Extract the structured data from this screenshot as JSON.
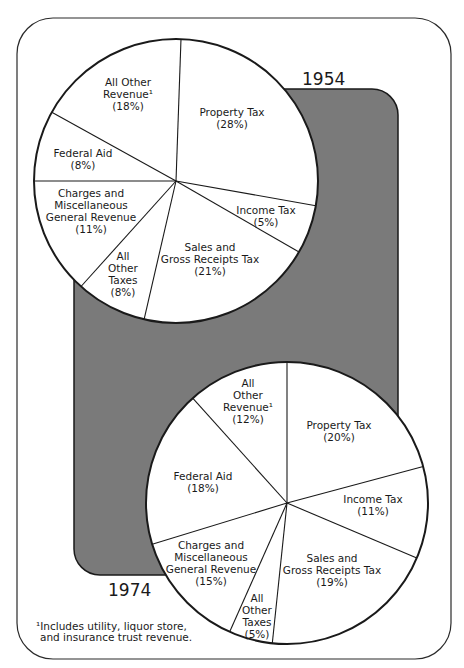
{
  "chart_data": [
    {
      "type": "pie",
      "title": "1954",
      "categories": [
        "Property Tax",
        "Income Tax",
        "Sales and Gross Receipts Tax",
        "All Other Taxes",
        "Charges and Miscellaneous General Revenue",
        "Federal Aid",
        "All Other Revenue¹"
      ],
      "values": [
        28,
        5,
        21,
        8,
        11,
        8,
        18
      ],
      "unit": "%"
    },
    {
      "type": "pie",
      "title": "1974",
      "categories": [
        "Property Tax",
        "Income Tax",
        "Sales and Gross Receipts Tax",
        "All Other Taxes",
        "Charges and Miscellaneous General Revenue",
        "Federal Aid",
        "All Other Revenue¹"
      ],
      "values": [
        20,
        11,
        19,
        5,
        15,
        18,
        12
      ],
      "unit": "%"
    }
  ],
  "colors": {
    "frame": "#2a2a2a",
    "shadow": "#7a7a7a",
    "pie_fill": "#ffffff",
    "ink": "#1a1a1a"
  },
  "pies": [
    {
      "year": "1954",
      "cx": 176,
      "cy": 181,
      "r": 142,
      "boundaries": [
        2,
        100,
        120,
        193,
        222,
        270,
        299
      ],
      "labels": [
        {
          "lines": [
            "Property Tax",
            "(28%)"
          ],
          "x": 232,
          "y": 116
        },
        {
          "lines": [
            "Income Tax",
            "(5%)"
          ],
          "x": 266,
          "y": 214,
          "anchor": "middle",
          "align": [
            "middle",
            "end"
          ],
          "endx": 292
        },
        {
          "lines": [
            "Sales and",
            "Gross Receipts Tax",
            "(21%)"
          ],
          "x": 210,
          "y": 251
        },
        {
          "lines": [
            "All",
            "Other",
            "Taxes",
            "(8%)"
          ],
          "x": 123,
          "y": 260
        },
        {
          "lines": [
            "Charges and",
            "Miscellaneous",
            "General Revenue",
            "(11%)"
          ],
          "x": 91,
          "y": 197
        },
        {
          "lines": [
            "Federal Aid",
            "(8%)"
          ],
          "x": 83,
          "y": 157
        },
        {
          "lines": [
            "All Other",
            "Revenue¹",
            "(18%)"
          ],
          "x": 128,
          "y": 86
        }
      ]
    },
    {
      "year": "1974",
      "cx": 287,
      "cy": 503,
      "r": 141,
      "boundaries": [
        0,
        75,
        113,
        186,
        204,
        253,
        318
      ],
      "labels": [
        {
          "lines": [
            "Property Tax",
            "(20%)"
          ],
          "x": 339,
          "y": 429
        },
        {
          "lines": [
            "Income Tax",
            "(11%)"
          ],
          "x": 373,
          "y": 503
        },
        {
          "lines": [
            "Sales and",
            "Gross Receipts Tax",
            "(19%)"
          ],
          "x": 332,
          "y": 562
        },
        {
          "lines": [
            "All",
            "Other",
            "Taxes",
            "(5%)"
          ],
          "x": 257,
          "y": 602
        },
        {
          "lines": [
            "Charges and",
            "Miscellaneous",
            "General Revenue",
            "(15%)"
          ],
          "x": 211,
          "y": 549
        },
        {
          "lines": [
            "Federal Aid",
            "(18%)"
          ],
          "x": 203,
          "y": 480
        },
        {
          "lines": [
            "All",
            "Other",
            "Revenue¹",
            "(12%)"
          ],
          "x": 248,
          "y": 387
        }
      ]
    }
  ],
  "year_labels": {
    "y1954": "1954",
    "y1974": "1974"
  },
  "footnote": {
    "line1": "¹Includes utility, liquor store,",
    "line2": "and insurance trust revenue."
  }
}
